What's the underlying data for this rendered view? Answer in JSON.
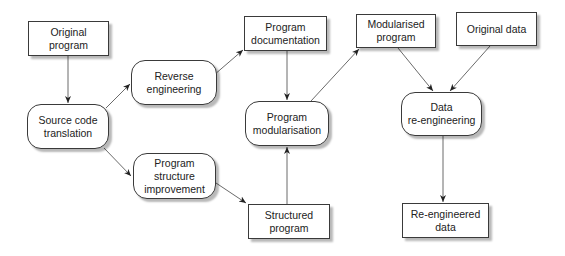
{
  "diagram": {
    "title": "",
    "nodes": [
      {
        "id": "original_program",
        "label": "Original\nprogram",
        "shape": "rect"
      },
      {
        "id": "source_code_translation",
        "label": "Source code\ntranslation",
        "shape": "rounded"
      },
      {
        "id": "reverse_engineering",
        "label": "Reverse\nengineering",
        "shape": "rounded"
      },
      {
        "id": "program_structure_improvement",
        "label": "Program\nstructure\nimprovement",
        "shape": "rounded"
      },
      {
        "id": "program_documentation",
        "label": "Program\ndocumentation",
        "shape": "rect"
      },
      {
        "id": "program_modularisation",
        "label": "Program\nmodularisation",
        "shape": "rounded"
      },
      {
        "id": "structured_program",
        "label": "Structured\nprogram",
        "shape": "rect"
      },
      {
        "id": "modularised_program",
        "label": "Modularised\nprogram",
        "shape": "rect"
      },
      {
        "id": "original_data",
        "label": "Original data",
        "shape": "rect"
      },
      {
        "id": "data_reengineering",
        "label": "Data\nre-engineering",
        "shape": "rounded"
      },
      {
        "id": "reengineered_data",
        "label": "Re-engineered\ndata",
        "shape": "rect"
      }
    ],
    "edges": [
      {
        "from": "original_program",
        "to": "source_code_translation"
      },
      {
        "from": "source_code_translation",
        "to": "reverse_engineering"
      },
      {
        "from": "source_code_translation",
        "to": "program_structure_improvement"
      },
      {
        "from": "reverse_engineering",
        "to": "program_documentation"
      },
      {
        "from": "program_documentation",
        "to": "program_modularisation"
      },
      {
        "from": "program_structure_improvement",
        "to": "structured_program"
      },
      {
        "from": "structured_program",
        "to": "program_modularisation"
      },
      {
        "from": "program_modularisation",
        "to": "modularised_program"
      },
      {
        "from": "modularised_program",
        "to": "data_reengineering"
      },
      {
        "from": "original_data",
        "to": "data_reengineering"
      },
      {
        "from": "data_reengineering",
        "to": "reengineered_data"
      }
    ],
    "colors": {
      "border": "#3a3a3a",
      "arrow": "#444444",
      "background": "#ffffff",
      "text": "#222222"
    }
  }
}
